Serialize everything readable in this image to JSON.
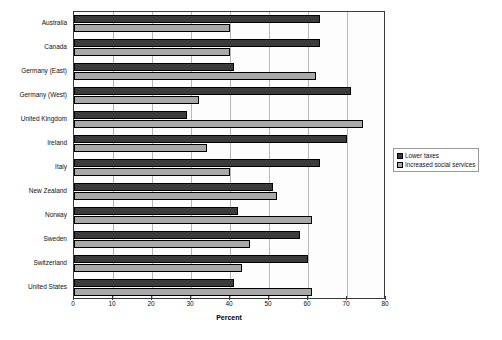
{
  "chart_data": {
    "type": "bar",
    "orientation": "horizontal",
    "title": "",
    "xlabel": "Percent",
    "ylabel": "",
    "xlim": [
      0,
      80
    ],
    "xticks": [
      0,
      10,
      20,
      30,
      40,
      50,
      60,
      70,
      80
    ],
    "grid": true,
    "legend_position": "right",
    "categories": [
      "Australia",
      "Canada",
      "Germany (East)",
      "Germany (West)",
      "United Kingdom",
      "Ireland",
      "Italy",
      "New Zealand",
      "Norway",
      "Sweden",
      "Switzerland",
      "United States"
    ],
    "series": [
      {
        "name": "Lower taxes",
        "color": "#3b3b3b",
        "values": [
          63,
          63,
          41,
          71,
          29,
          70,
          63,
          51,
          42,
          58,
          60,
          41
        ]
      },
      {
        "name": "Increased social services",
        "color": "#a9a9a9",
        "values": [
          40,
          40,
          62,
          32,
          74,
          34,
          40,
          52,
          61,
          45,
          43,
          61
        ]
      }
    ]
  },
  "axis": {
    "x_title": "Percent"
  }
}
